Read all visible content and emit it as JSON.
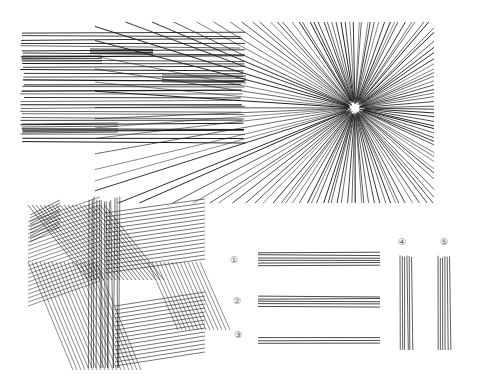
{
  "figure": {
    "ink_color": "#1a1a1a",
    "background": "#ffffff",
    "panels": [
      {
        "id": "horizontal-lines",
        "label": ""
      },
      {
        "id": "radiating-lines",
        "label": ""
      },
      {
        "id": "crosshatch-lines",
        "label": ""
      }
    ],
    "numbered_sets": [
      {
        "label": "①",
        "orientation": "horizontal"
      },
      {
        "label": "②",
        "orientation": "horizontal"
      },
      {
        "label": "③",
        "orientation": "horizontal"
      },
      {
        "label": "④",
        "orientation": "vertical"
      },
      {
        "label": "⑤",
        "orientation": "vertical"
      }
    ]
  }
}
